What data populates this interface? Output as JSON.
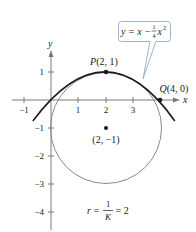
{
  "figure": {
    "axes": {
      "x_label": "x",
      "y_label": "y",
      "x_ticks": [
        {
          "value": -1,
          "label": "−1"
        },
        {
          "value": 1,
          "label": "1"
        },
        {
          "value": 2,
          "label": "2"
        },
        {
          "value": 3,
          "label": "3"
        }
      ],
      "y_ticks": [
        {
          "value": 1,
          "label": "1"
        },
        {
          "value": -1,
          "label": "−1"
        },
        {
          "value": -2,
          "label": "−2"
        },
        {
          "value": -3,
          "label": "−3"
        },
        {
          "value": -4,
          "label": "−4"
        }
      ]
    },
    "curves": {
      "parabola": {
        "equation_text": "y = x − ¼x²",
        "color": "#1a1a1a"
      },
      "circle": {
        "center": [
          2,
          -1
        ],
        "radius": 2,
        "color": "#8a8a8a"
      }
    },
    "points": {
      "P": {
        "label_prefix": "P",
        "label_coords": "(2, 1)",
        "x": 2,
        "y": 1
      },
      "Q": {
        "label_prefix": "Q",
        "label_coords": "(4, 0)",
        "x": 4,
        "y": 0
      },
      "center": {
        "label": "(2, −1)",
        "x": 2,
        "y": -1
      }
    },
    "callout": {
      "lhs": "y = x − ",
      "frac_num": "1",
      "frac_den": "4",
      "rhs_var": "x",
      "rhs_exp": "2",
      "border_color": "#9fb3c8"
    },
    "radius_note": {
      "lhs": "r = ",
      "frac_num": "1",
      "frac_den": "K",
      "rhs": " = 2"
    }
  }
}
